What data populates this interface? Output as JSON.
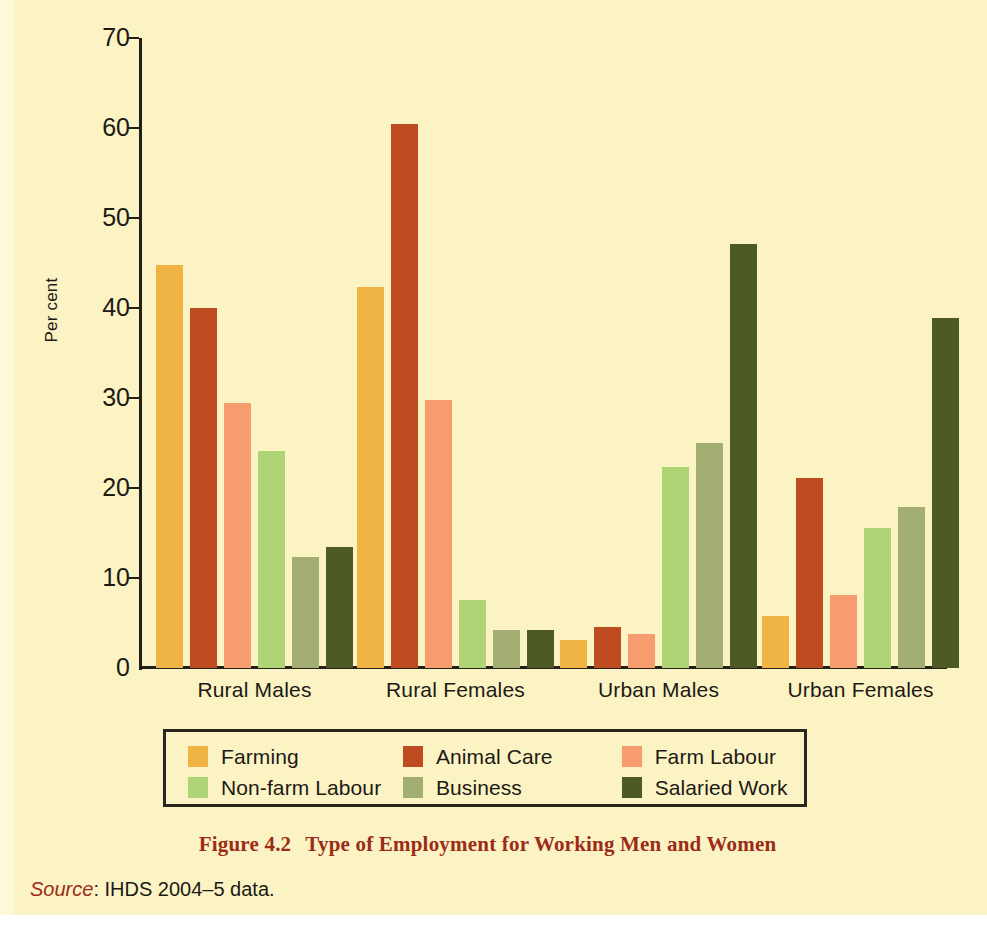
{
  "figure": {
    "caption_number": "Figure 4.2",
    "caption_title": "Type of Employment for Working Men and Women",
    "source_word": "Source",
    "source_text": ": IHDS 2004–5 data."
  },
  "colors": {
    "page_background": "#fbf3c4",
    "axis": "#23201a",
    "text": "#1d1a14",
    "caption": "#9b2c18",
    "farming": "#efb444",
    "animal_care": "#bf4b20",
    "farm_labour": "#f79c6e",
    "non_farm_labour": "#afd475",
    "business": "#a3af72",
    "salaried_work": "#4e5a26"
  },
  "legend": {
    "rows": [
      [
        {
          "label": "Farming",
          "color": "#efb444"
        },
        {
          "label": "Animal Care",
          "color": "#bf4b20"
        },
        {
          "label": "Farm Labour",
          "color": "#f79c6e"
        }
      ],
      [
        {
          "label": "Non-farm Labour",
          "color": "#afd475"
        },
        {
          "label": "Business",
          "color": "#a3af72"
        },
        {
          "label": "Salaried Work",
          "color": "#4e5a26"
        }
      ]
    ]
  },
  "chart_data": {
    "type": "bar",
    "title": "Type of Employment for Working Men and Women",
    "xlabel": "",
    "ylabel": "Per cent",
    "ylim": [
      0,
      70
    ],
    "yticks": [
      0,
      10,
      20,
      30,
      40,
      50,
      60,
      70
    ],
    "grid": false,
    "legend_position": "bottom",
    "categories": [
      "Rural Males",
      "Rural Females",
      "Urban Males",
      "Urban Females"
    ],
    "series": [
      {
        "name": "Farming",
        "color": "#efb444",
        "values": [
          44.8,
          42.3,
          3.1,
          5.8
        ]
      },
      {
        "name": "Animal Care",
        "color": "#bf4b20",
        "values": [
          40.0,
          60.4,
          4.6,
          21.1
        ]
      },
      {
        "name": "Farm Labour",
        "color": "#f79c6e",
        "values": [
          29.4,
          29.8,
          3.8,
          8.1
        ]
      },
      {
        "name": "Non-farm Labour",
        "color": "#afd475",
        "values": [
          24.1,
          7.6,
          22.3,
          15.6
        ]
      },
      {
        "name": "Business",
        "color": "#a3af72",
        "values": [
          12.3,
          4.2,
          25.0,
          17.9
        ]
      },
      {
        "name": "Salaried Work",
        "color": "#4e5a26",
        "values": [
          13.4,
          4.2,
          47.1,
          38.9
        ]
      }
    ]
  }
}
